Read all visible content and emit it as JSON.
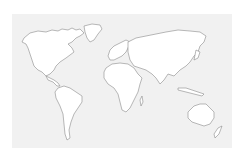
{
  "map": {
    "type": "world-outline",
    "background_color": "#f1f1f1",
    "land_color": "#ffffff",
    "border_color": "#8a8a8a",
    "continents": [
      "North America",
      "Greenland",
      "South America",
      "Europe",
      "Africa",
      "Asia",
      "Australia",
      "New Zealand"
    ]
  }
}
